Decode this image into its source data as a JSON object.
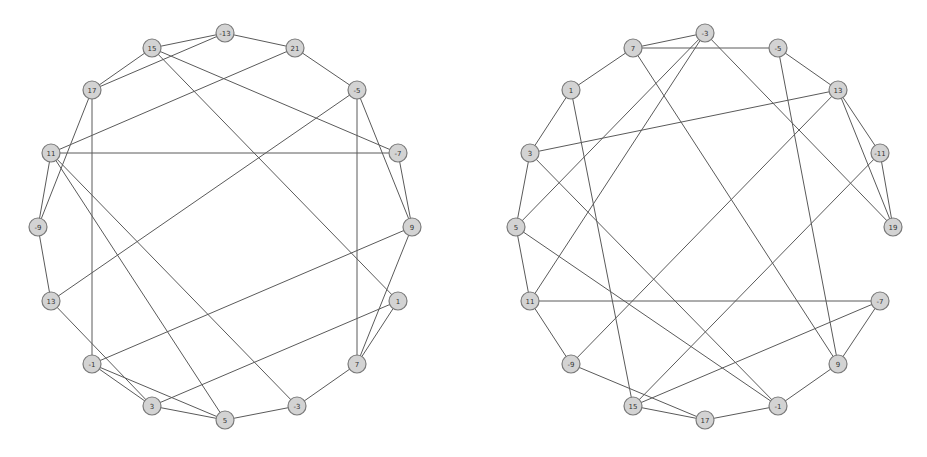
{
  "style": {
    "node_fill": "#d3d3d3",
    "node_stroke": "#7a7a7a",
    "edge_color": "#5a5a5a",
    "background": "#ffffff",
    "node_radius": 9
  },
  "graphs": [
    {
      "name": "left-graph",
      "nodes": [
        {
          "id": "n-13",
          "label": "-13",
          "x": 225,
          "y": 33
        },
        {
          "id": "n15",
          "label": "15",
          "x": 152,
          "y": 48
        },
        {
          "id": "n21",
          "label": "21",
          "x": 295,
          "y": 48
        },
        {
          "id": "n17",
          "label": "17",
          "x": 92,
          "y": 90
        },
        {
          "id": "n-5",
          "label": "-5",
          "x": 357,
          "y": 90
        },
        {
          "id": "n11",
          "label": "11",
          "x": 51,
          "y": 153
        },
        {
          "id": "n-7",
          "label": "-7",
          "x": 398,
          "y": 153
        },
        {
          "id": "n-9",
          "label": "-9",
          "x": 38,
          "y": 227
        },
        {
          "id": "n9",
          "label": "9",
          "x": 412,
          "y": 227
        },
        {
          "id": "n13",
          "label": "13",
          "x": 51,
          "y": 301
        },
        {
          "id": "n1",
          "label": "1",
          "x": 398,
          "y": 301
        },
        {
          "id": "n-1",
          "label": "-1",
          "x": 92,
          "y": 364
        },
        {
          "id": "n7",
          "label": "7",
          "x": 357,
          "y": 364
        },
        {
          "id": "n3",
          "label": "3",
          "x": 152,
          "y": 406
        },
        {
          "id": "n-3",
          "label": "-3",
          "x": 297,
          "y": 406
        },
        {
          "id": "n5",
          "label": "5",
          "x": 225,
          "y": 420
        }
      ],
      "edges": [
        [
          "n-13",
          "n15"
        ],
        [
          "n-13",
          "n21"
        ],
        [
          "n-13",
          "n17"
        ],
        [
          "n15",
          "n17"
        ],
        [
          "n15",
          "n-7"
        ],
        [
          "n15",
          "n1"
        ],
        [
          "n21",
          "n-5"
        ],
        [
          "n21",
          "n11"
        ],
        [
          "n17",
          "n-9"
        ],
        [
          "n17",
          "n-1"
        ],
        [
          "n-5",
          "n7"
        ],
        [
          "n-5",
          "n9"
        ],
        [
          "n-5",
          "n13"
        ],
        [
          "n11",
          "n-7"
        ],
        [
          "n11",
          "n-9"
        ],
        [
          "n11",
          "n5"
        ],
        [
          "n11",
          "n-3"
        ],
        [
          "n-7",
          "n9"
        ],
        [
          "n-9",
          "n13"
        ],
        [
          "n13",
          "n3"
        ],
        [
          "n9",
          "n-1"
        ],
        [
          "n9",
          "n7"
        ],
        [
          "n1",
          "n7"
        ],
        [
          "n1",
          "n3"
        ],
        [
          "n-1",
          "n3"
        ],
        [
          "n-1",
          "n5"
        ],
        [
          "n3",
          "n5"
        ],
        [
          "n5",
          "n-3"
        ],
        [
          "n-3",
          "n7"
        ]
      ]
    },
    {
      "name": "right-graph",
      "nodes": [
        {
          "id": "m-3",
          "label": "-3",
          "x": 705,
          "y": 33
        },
        {
          "id": "m7",
          "label": "7",
          "x": 633,
          "y": 48
        },
        {
          "id": "m-5",
          "label": "-5",
          "x": 778,
          "y": 48
        },
        {
          "id": "m1",
          "label": "1",
          "x": 571,
          "y": 90
        },
        {
          "id": "m13",
          "label": "13",
          "x": 838,
          "y": 90
        },
        {
          "id": "m3",
          "label": "3",
          "x": 530,
          "y": 153
        },
        {
          "id": "m-11",
          "label": "-11",
          "x": 880,
          "y": 153
        },
        {
          "id": "m5",
          "label": "5",
          "x": 516,
          "y": 227
        },
        {
          "id": "m19",
          "label": "19",
          "x": 893,
          "y": 227
        },
        {
          "id": "m11",
          "label": "11",
          "x": 530,
          "y": 301
        },
        {
          "id": "m-7",
          "label": "-7",
          "x": 880,
          "y": 301
        },
        {
          "id": "m-9",
          "label": "-9",
          "x": 571,
          "y": 364
        },
        {
          "id": "m9",
          "label": "9",
          "x": 838,
          "y": 364
        },
        {
          "id": "m15",
          "label": "15",
          "x": 633,
          "y": 406
        },
        {
          "id": "m-1",
          "label": "-1",
          "x": 778,
          "y": 406
        },
        {
          "id": "m17",
          "label": "17",
          "x": 705,
          "y": 420
        }
      ],
      "edges": [
        [
          "m-3",
          "m7"
        ],
        [
          "m-3",
          "m5"
        ],
        [
          "m-3",
          "m11"
        ],
        [
          "m-3",
          "m19"
        ],
        [
          "m7",
          "m-5"
        ],
        [
          "m7",
          "m1"
        ],
        [
          "m7",
          "m9"
        ],
        [
          "m-5",
          "m13"
        ],
        [
          "m-5",
          "m9"
        ],
        [
          "m1",
          "m3"
        ],
        [
          "m1",
          "m15"
        ],
        [
          "m13",
          "m3"
        ],
        [
          "m13",
          "m-11"
        ],
        [
          "m13",
          "m19"
        ],
        [
          "m13",
          "m-9"
        ],
        [
          "m-11",
          "m19"
        ],
        [
          "m-11",
          "m15"
        ],
        [
          "m3",
          "m5"
        ],
        [
          "m3",
          "m-1"
        ],
        [
          "m5",
          "m11"
        ],
        [
          "m5",
          "m-1"
        ],
        [
          "m11",
          "m-7"
        ],
        [
          "m11",
          "m-9"
        ],
        [
          "m-7",
          "m9"
        ],
        [
          "m-7",
          "m15"
        ],
        [
          "m-9",
          "m17"
        ],
        [
          "m15",
          "m17"
        ],
        [
          "m17",
          "m-1"
        ],
        [
          "m-1",
          "m9"
        ]
      ]
    }
  ]
}
